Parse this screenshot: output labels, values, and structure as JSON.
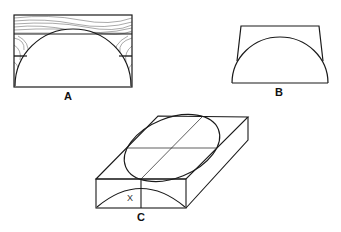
{
  "figure": {
    "type": "woodworking technical diagram",
    "panels": [
      {
        "id": "A",
        "label": "A",
        "description": "Rectangular laminated wood block with semicircular profile cut; wood grain hatching in waste areas"
      },
      {
        "id": "B",
        "label": "B",
        "description": "Trapezoidal profile with semicircular arc"
      },
      {
        "id": "C",
        "label": "C",
        "description": "Isometric block with ellipse on top face and arc on front face",
        "dimension_label": "X"
      }
    ]
  },
  "colors": {
    "line": "#1a1a1a",
    "background": "#ffffff",
    "grain": "#555555"
  }
}
